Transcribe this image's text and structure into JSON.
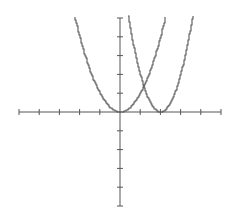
{
  "chart_data": {
    "type": "line",
    "title": "",
    "xlabel": "",
    "ylabel": "",
    "xlim": [
      -5,
      5
    ],
    "ylim": [
      -5,
      5
    ],
    "grid": false,
    "legend": null,
    "x_ticks": [
      -5,
      -4,
      -3,
      -2,
      -1,
      1,
      2,
      3,
      4,
      5
    ],
    "y_ticks": [
      -5,
      -4,
      -3,
      -2,
      -1,
      1,
      2,
      3,
      4,
      5
    ],
    "series": [
      {
        "name": "y = x^2",
        "x": [
          -2.25,
          -2,
          -1.5,
          -1,
          -0.5,
          0,
          0.5,
          1,
          1.5,
          2,
          2.25
        ],
        "values": [
          5.06,
          4,
          2.25,
          1,
          0.25,
          0,
          0.25,
          1,
          2.25,
          4,
          5.06
        ]
      },
      {
        "name": "y = 2(x-2)^2",
        "x": [
          0.4,
          0.75,
          1,
          1.5,
          2,
          2.5,
          3,
          3.25,
          3.6
        ],
        "values": [
          5.12,
          3.13,
          2,
          0.5,
          0,
          0.5,
          2,
          3.13,
          5.12
        ]
      }
    ],
    "annotations": []
  },
  "style": {
    "axis_color": "#555555",
    "curve_color": "#555555",
    "background": "#ffffff"
  }
}
